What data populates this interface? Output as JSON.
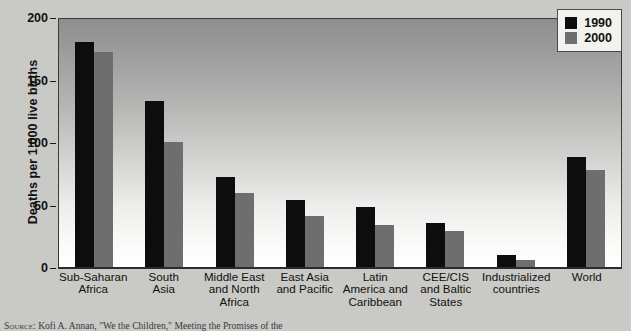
{
  "chart_data": {
    "type": "bar",
    "title": "",
    "xlabel": "",
    "ylabel": "Deaths per 1,000 live births",
    "ylim": [
      0,
      200
    ],
    "yticks": [
      0,
      50,
      100,
      150,
      200
    ],
    "grid": false,
    "legend_position": "top-right",
    "categories": [
      "Sub-Saharan Africa",
      "South Asia",
      "Middle East and North Africa",
      "East Asia and Pacific",
      "Latin America and Caribbean",
      "CEE/CIS and Baltic States",
      "Industrialized countries",
      "World"
    ],
    "category_lines": [
      [
        "Sub-Saharan",
        "Africa"
      ],
      [
        "South",
        "Asia"
      ],
      [
        "Middle East",
        "and North",
        "Africa"
      ],
      [
        "East Asia",
        "and Pacific"
      ],
      [
        "Latin",
        "America and",
        "Caribbean"
      ],
      [
        "CEE/CIS",
        "and Baltic",
        "States"
      ],
      [
        "Industrialized",
        "countries"
      ],
      [
        "World"
      ]
    ],
    "series": [
      {
        "name": "1990",
        "color": "#0d0d0d",
        "values": [
          180,
          133,
          72,
          54,
          48,
          35,
          10,
          88
        ]
      },
      {
        "name": "2000",
        "color": "#6e6e6e",
        "values": [
          172,
          100,
          59,
          41,
          34,
          29,
          6,
          78
        ]
      }
    ]
  },
  "legend": {
    "items": [
      {
        "label": "1990",
        "swatch": "black-square-swatch"
      },
      {
        "label": "2000",
        "swatch": "gray-square-swatch"
      }
    ]
  },
  "source": {
    "lead": "Source:",
    "text": "Kofi A. Annan, \"We the Children,\" Meeting the Promises of the"
  }
}
